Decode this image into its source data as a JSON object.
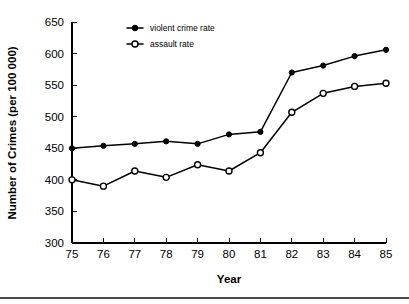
{
  "chart_data": {
    "type": "line",
    "title": "",
    "xlabel": "Year",
    "ylabel": "Number of Crimes (per 100 000)",
    "categories": [
      "75",
      "76",
      "77",
      "78",
      "79",
      "80",
      "81",
      "82",
      "83",
      "84",
      "85"
    ],
    "x": [
      75,
      76,
      77,
      78,
      79,
      80,
      81,
      82,
      83,
      84,
      85
    ],
    "series": [
      {
        "name": "violent crime rate",
        "marker": "filled-circle",
        "color": "#000000",
        "values": [
          450,
          454,
          457,
          461,
          457,
          472,
          476,
          570,
          581,
          596,
          606
        ]
      },
      {
        "name": "assault rate",
        "marker": "open-circle",
        "color": "#000000",
        "values": [
          400,
          390,
          414,
          404,
          424,
          414,
          443,
          507,
          537,
          548,
          553
        ]
      }
    ],
    "ylim": [
      300,
      650
    ],
    "yticks": [
      300,
      350,
      400,
      450,
      500,
      550,
      600,
      650
    ],
    "ytick_labels": [
      "300",
      "350",
      "400",
      "450",
      "500",
      "550",
      "600",
      "650"
    ],
    "xlim": [
      75,
      85
    ],
    "xticks": [
      75,
      76,
      77,
      78,
      79,
      80,
      81,
      82,
      83,
      84,
      85
    ],
    "xtick_labels": [
      "75",
      "76",
      "77",
      "78",
      "79",
      "80",
      "81",
      "82",
      "83",
      "84",
      "85"
    ],
    "grid": false,
    "legend_position": "top-left-inside"
  },
  "legend": {
    "entries": [
      {
        "label": "violent crime rate",
        "marker": "filled-circle"
      },
      {
        "label": "assault rate",
        "marker": "open-circle"
      }
    ]
  },
  "axes": {
    "y_title": "Number of Crimes (per 100 000)",
    "x_title": "Year"
  }
}
